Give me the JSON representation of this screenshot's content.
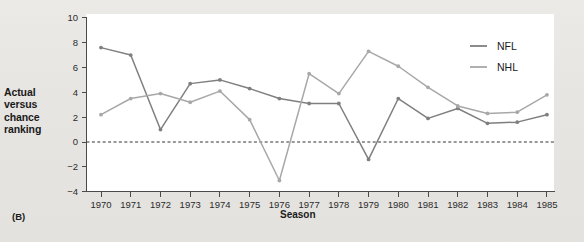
{
  "panel": {
    "tag": "(B)"
  },
  "axes": {
    "ylabel_lines": [
      "Actual",
      "versus",
      "chance",
      "ranking"
    ],
    "xlabel": "Season",
    "yticks": [
      "10",
      "8",
      "6",
      "4",
      "2",
      "0",
      "-2",
      "-4"
    ],
    "ytick_values": [
      10,
      8,
      6,
      4,
      2,
      0,
      -2,
      -4
    ],
    "ylim": [
      -4,
      10
    ],
    "zero_reference": 0
  },
  "legend": {
    "position": "top-right-inside",
    "entries": [
      {
        "label": "NFL",
        "color": "#7f7f7f"
      },
      {
        "label": "NHL",
        "color": "#a8a8a8"
      }
    ]
  },
  "chart_data": {
    "type": "line",
    "title": "",
    "subtitle": "",
    "xlabel": "Season",
    "ylabel": "Actual versus chance ranking",
    "categories": [
      "1970",
      "1971",
      "1972",
      "1973",
      "1974",
      "1975",
      "1976",
      "1977",
      "1978",
      "1979",
      "1980",
      "1981",
      "1982",
      "1983",
      "1984",
      "1985"
    ],
    "x": [
      1970,
      1971,
      1972,
      1973,
      1974,
      1975,
      1976,
      1977,
      1978,
      1979,
      1980,
      1981,
      1982,
      1983,
      1984,
      1985
    ],
    "xlim": [
      1969.5,
      1985.5
    ],
    "ylim": [
      -4,
      10
    ],
    "grid": false,
    "legend_position": "upper right",
    "annotations": [
      {
        "text": "(B)",
        "kind": "panel-label"
      },
      {
        "text": "zero reference dashed line at y = 0",
        "kind": "reference-line"
      }
    ],
    "series": [
      {
        "name": "NFL",
        "color": "#7f7f7f",
        "values": [
          7.6,
          7.0,
          1.0,
          4.7,
          5.0,
          4.3,
          3.5,
          3.1,
          3.1,
          -1.4,
          3.5,
          1.9,
          2.7,
          1.5,
          1.6,
          2.2
        ]
      },
      {
        "name": "NHL",
        "color": "#a8a8a8",
        "values": [
          2.2,
          3.5,
          3.9,
          3.2,
          4.1,
          1.8,
          -3.1,
          5.5,
          3.9,
          7.3,
          6.1,
          4.4,
          2.9,
          2.3,
          2.4,
          3.8
        ]
      }
    ]
  }
}
